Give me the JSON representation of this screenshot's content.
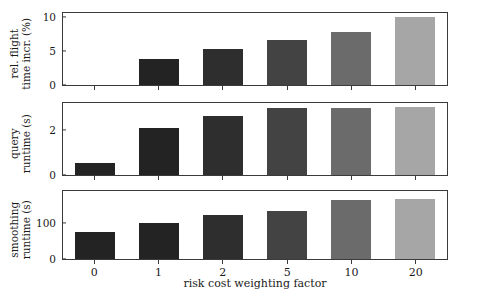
{
  "chart_data": {
    "type": "bar",
    "title": "",
    "xlabel": "risk cost weighting factor",
    "categories": [
      "0",
      "1",
      "2",
      "5",
      "10",
      "20"
    ],
    "grid": false,
    "legend": "none",
    "panels": [
      {
        "name": "rel-flight-time-incr",
        "ylabel_lines": [
          "rel. flight",
          "time incr. (%)"
        ],
        "ylabel": "rel. flight time incr. (%)",
        "yticks": [
          0,
          5,
          10
        ],
        "ytick_labels": [
          "0",
          "5",
          "10"
        ],
        "ylim": [
          0,
          10.6
        ],
        "values": [
          0,
          3.9,
          5.4,
          6.6,
          7.8,
          10.0
        ]
      },
      {
        "name": "query-runtime",
        "ylabel_lines": [
          "query",
          "runtime (s)"
        ],
        "ylabel": "query runtime (s)",
        "yticks": [
          0,
          2
        ],
        "ytick_labels": [
          "0",
          "2"
        ],
        "ylim": [
          0,
          3.2
        ],
        "values": [
          0.55,
          2.1,
          2.65,
          3.0,
          3.0,
          3.05
        ]
      },
      {
        "name": "smoothing-runtime",
        "ylabel_lines": [
          "smoothing",
          "runtime (s)"
        ],
        "ylabel": "smoothing runtime (s)",
        "yticks": [
          0,
          100
        ],
        "ytick_labels": [
          "0",
          "100"
        ],
        "ylim": [
          0,
          190
        ],
        "values": [
          75,
          101,
          125,
          135,
          165,
          170
        ]
      }
    ],
    "bar_colors": [
      "#232323",
      "#232323",
      "#2e2e2e",
      "#434343",
      "#6b6b6b",
      "#a6a6a6"
    ]
  },
  "figure": {
    "background": "#ffffff",
    "axis_color": "#3a3a3a",
    "text_color": "#1a1a1a"
  }
}
